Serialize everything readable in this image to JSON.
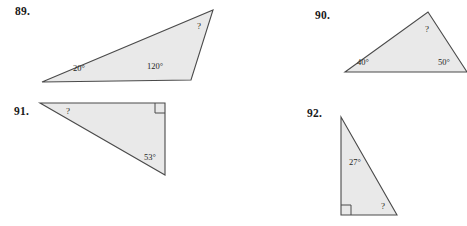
{
  "page": {
    "background_color": "#ffffff",
    "width": 467,
    "height": 226,
    "content_type": "geometry-exercise-figures",
    "unknown_symbol": "?"
  },
  "style": {
    "triangle_fill": "#e9e9e9",
    "triangle_stroke": "#4a4a4a",
    "label_color": "#1f1f1f",
    "number_color": "#1a1a1a"
  },
  "problems": [
    {
      "number": "89.",
      "shape": "obtuse-triangle",
      "angles": [
        {
          "name": "angle-20",
          "value": "20°",
          "known": true
        },
        {
          "name": "angle-120",
          "value": "120°",
          "known": true
        },
        {
          "name": "angle-unknown",
          "value": "?",
          "known": false
        }
      ],
      "right_angle_marked": false
    },
    {
      "number": "90.",
      "shape": "acute-triangle",
      "angles": [
        {
          "name": "angle-40",
          "value": "40°",
          "known": true
        },
        {
          "name": "angle-50",
          "value": "50°",
          "known": true
        },
        {
          "name": "angle-unknown",
          "value": "?",
          "known": false
        }
      ],
      "right_angle_marked": false
    },
    {
      "number": "91.",
      "shape": "right-triangle",
      "angles": [
        {
          "name": "angle-unknown",
          "value": "?",
          "known": false
        },
        {
          "name": "angle-53",
          "value": "53°",
          "known": true
        },
        {
          "name": "angle-right",
          "value": "90°",
          "known": true
        }
      ],
      "right_angle_marked": true
    },
    {
      "number": "92.",
      "shape": "right-triangle",
      "angles": [
        {
          "name": "angle-27",
          "value": "27°",
          "known": true
        },
        {
          "name": "angle-unknown",
          "value": "?",
          "known": false
        },
        {
          "name": "angle-right",
          "value": "90°",
          "known": true
        }
      ],
      "right_angle_marked": true
    }
  ]
}
